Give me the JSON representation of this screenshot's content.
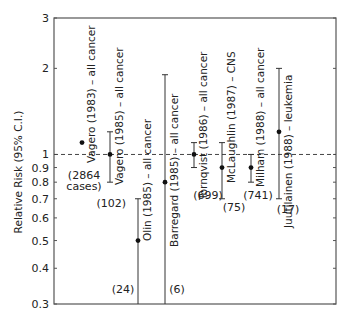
{
  "chart_data": {
    "type": "scatter",
    "subtype": "forest-plot-log-scale",
    "title": "",
    "xlabel": "",
    "ylabel": "Relative Risk (95% C.I.)",
    "yscale": "log",
    "ylim": [
      0.3,
      3
    ],
    "yticks": [
      {
        "value": 3,
        "label": "3"
      },
      {
        "value": 2,
        "label": "2"
      },
      {
        "value": 1,
        "label": "1"
      },
      {
        "value": 0.9,
        "label": "0.9"
      },
      {
        "value": 0.8,
        "label": "0.8"
      },
      {
        "value": 0.7,
        "label": "0.7"
      },
      {
        "value": 0.6,
        "label": "0.6"
      },
      {
        "value": 0.5,
        "label": "0.5"
      },
      {
        "value": 0.4,
        "label": "0.4"
      },
      {
        "value": 0.3,
        "label": "0.3"
      }
    ],
    "reference_line": {
      "value": 1,
      "style": "dashed"
    },
    "grid": false,
    "legend": null,
    "studies": [
      {
        "label": "Vagero (1983) – all cancer",
        "rr": 1.1,
        "ci_low": null,
        "ci_high": null,
        "n_label": "(2864",
        "n_label2": "cases)",
        "x": 82
      },
      {
        "label": "Vagero (1985) – all cancer",
        "rr": 1.0,
        "ci_low": 0.8,
        "ci_high": 1.2,
        "n_label": "(102)",
        "x": 110
      },
      {
        "label": "Olin (1985) – all cancer",
        "rr": 0.5,
        "ci_low": 0.3,
        "ci_high": 0.7,
        "n_label": "(24)",
        "x": 138
      },
      {
        "label": "Barregard (1985) – all cancer",
        "rr": 0.8,
        "ci_low": 0.3,
        "ci_high": 1.9,
        "n_label": "(6)",
        "x": 165
      },
      {
        "label": "Tornqvist (1986) – all cancer",
        "rr": 1.0,
        "ci_low": 0.9,
        "ci_high": 1.1,
        "n_label": "(699)",
        "x": 194
      },
      {
        "label": "McLaughlin (1987) – CNS",
        "rr": 0.9,
        "ci_low": 0.7,
        "ci_high": 1.1,
        "n_label": "(75)",
        "x": 222
      },
      {
        "label": "Milham (1988) – all cancer",
        "rr": 0.9,
        "ci_low": 0.8,
        "ci_high": 1.0,
        "n_label": "(741)",
        "x": 251
      },
      {
        "label": "Juutilainen (1988) – leukemia",
        "rr": 1.2,
        "ci_low": 0.7,
        "ci_high": 2.0,
        "n_label": "(17)",
        "x": 279
      }
    ]
  },
  "layout": {
    "frame": {
      "left": 54,
      "top": 18,
      "right": 336,
      "bottom": 304
    },
    "colors": {
      "axis": "#555555",
      "point": "#111111",
      "text": "#222222",
      "ref_line": "#444444"
    }
  }
}
